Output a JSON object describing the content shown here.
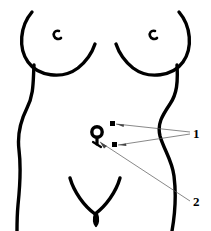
{
  "figure": {
    "kind": "line-art-anatomical-diagram",
    "width": 211,
    "height": 231,
    "background_color": "#ffffff",
    "outline_color": "#000000",
    "leader_line_color": "#555555",
    "outline_stroke_width": 3.4,
    "leader_stroke_width": 0.7
  },
  "body_parts": [
    {
      "id": "left-breast",
      "name": "Left breast outline"
    },
    {
      "id": "right-breast",
      "name": "Right breast outline"
    },
    {
      "id": "left-nipple",
      "name": "Left nipple mark"
    },
    {
      "id": "right-nipple",
      "name": "Right nipple mark"
    },
    {
      "id": "left-torso",
      "name": "Left flank / waist contour"
    },
    {
      "id": "right-torso",
      "name": "Right flank / waist contour"
    },
    {
      "id": "pubic-v",
      "name": "Pubic region V mark"
    },
    {
      "id": "navel-ring",
      "name": "Navel ring marker"
    }
  ],
  "markers": [
    {
      "id": "marker-upper",
      "shape": "square",
      "x": 112,
      "y": 124,
      "size": 5,
      "color": "#000000",
      "refers_to": "1"
    },
    {
      "id": "marker-lower",
      "shape": "square",
      "x": 114,
      "y": 145,
      "size": 5,
      "color": "#000000",
      "refers_to": "1"
    },
    {
      "id": "marker-navel",
      "shape": "ring",
      "x": 97,
      "y": 134,
      "size": 11,
      "color": "#000000",
      "refers_to": "2"
    }
  ],
  "callouts": [
    {
      "id": "callout-1",
      "label": "1",
      "label_x": 193,
      "label_y": 127,
      "anchor_x": 190,
      "anchor_y": 133,
      "leaders": [
        {
          "from_x": 116,
          "from_y": 124,
          "to_x": 190,
          "to_y": 132
        },
        {
          "from_x": 118,
          "from_y": 145,
          "to_x": 190,
          "to_y": 134
        }
      ]
    },
    {
      "id": "callout-2",
      "label": "2",
      "label_x": 193,
      "label_y": 195,
      "anchor_x": 190,
      "anchor_y": 201,
      "leaders": [
        {
          "from_x": 100,
          "from_y": 142,
          "to_x": 190,
          "to_y": 201
        }
      ]
    }
  ]
}
